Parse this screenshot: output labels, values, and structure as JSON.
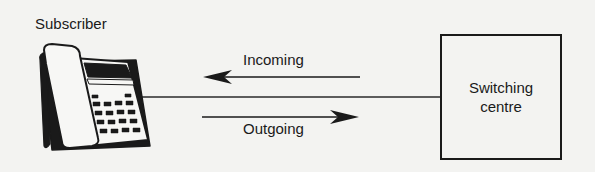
{
  "diagram": {
    "subscriber": {
      "label": "Subscriber",
      "icon": "desk-telephone-icon"
    },
    "incoming": {
      "label": "Incoming",
      "direction": "right-to-left"
    },
    "outgoing": {
      "label": "Outgoing",
      "direction": "left-to-right"
    },
    "switching_centre": {
      "label_line1": "Switching",
      "label_line2": "centre"
    },
    "colors": {
      "background": "#f3f3f1",
      "ink": "#1a1a1a"
    }
  }
}
